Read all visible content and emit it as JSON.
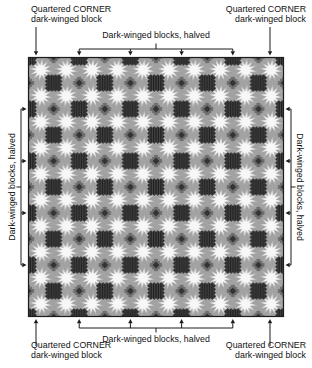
{
  "annotations": {
    "top_left_corner": {
      "line1": "Quartered CORNER",
      "line2": "dark-winged block"
    },
    "top_right_corner": {
      "line1": "Quartered CORNER",
      "line2": "dark-winged block"
    },
    "bottom_left_corner": {
      "line1": "Quartered CORNER",
      "line2": "dark-winged block"
    },
    "bottom_right_corner": {
      "line1": "Quartered CORNER",
      "line2": "dark-winged block"
    },
    "top_edge": "Dark-winged blocks, halved",
    "bottom_edge": "Dark-winged blocks, halved",
    "left_edge": "Dark-winged blocks, halved",
    "right_edge": "Dark-winged blocks, halved"
  },
  "quilt": {
    "colors": {
      "dark": "#1f1f1f",
      "stripe": "#474747",
      "mid_gray": "#a2a2a2",
      "diamond_gray": "#6f6f6f",
      "diamond_core": "#333333",
      "halo": "#c6c6c6",
      "white": "#f7f7f7",
      "border": "#1c1c1c",
      "annotation": "#1a1a1a"
    }
  }
}
